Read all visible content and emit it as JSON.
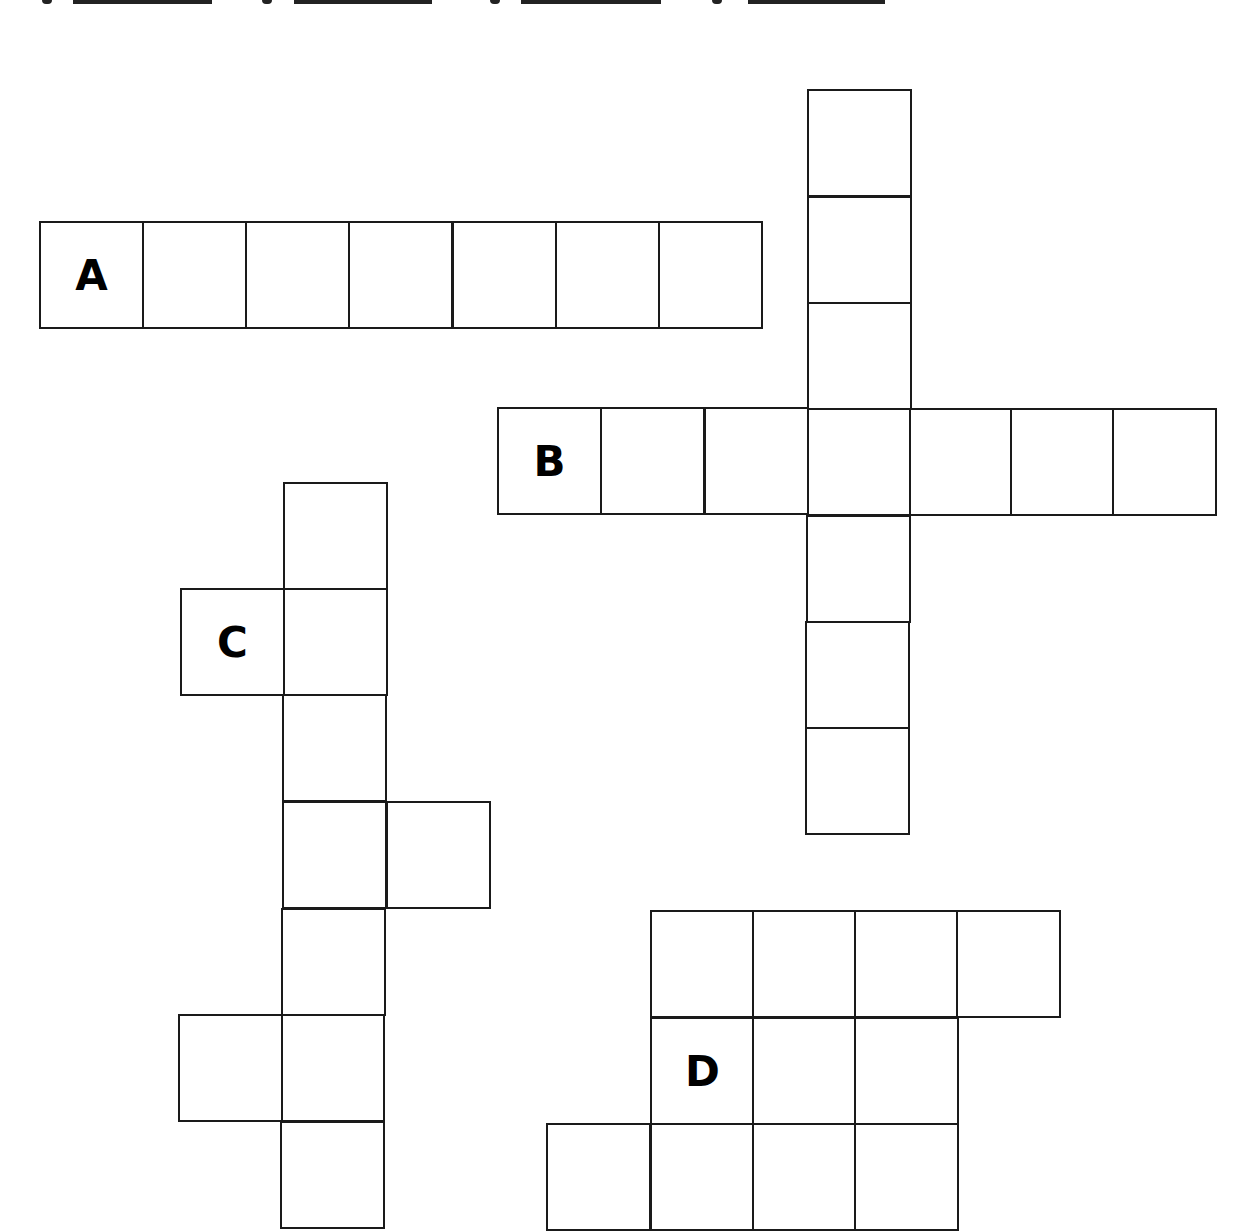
{
  "header": {
    "answer_blanks": [
      {
        "letter": "A",
        "glyph_x": 42,
        "line_x": 73,
        "line_w": 139
      },
      {
        "letter": "B",
        "glyph_x": 262,
        "line_x": 294,
        "line_w": 138
      },
      {
        "letter": "C",
        "glyph_x": 490,
        "line_x": 521,
        "line_w": 140
      },
      {
        "letter": "D",
        "glyph_x": 712,
        "line_x": 748,
        "line_w": 137
      }
    ]
  },
  "puzzle": {
    "type": "crossword-grid",
    "stroke_color": "#1a1a1a",
    "words": [
      {
        "label": "A",
        "direction": "across",
        "length": 7,
        "cells": [
          [
            39,
            221
          ],
          [
            142,
            221
          ],
          [
            245,
            221
          ],
          [
            348,
            221
          ],
          [
            452,
            221
          ],
          [
            555,
            221
          ],
          [
            658,
            221
          ]
        ],
        "label_cell": 0
      },
      {
        "label": "",
        "direction": "down",
        "length": 7,
        "cells": [
          [
            807,
            89
          ],
          [
            807,
            196
          ],
          [
            807,
            302
          ],
          [
            807,
            408
          ],
          [
            806,
            515
          ],
          [
            805,
            621
          ],
          [
            805,
            727
          ]
        ]
      },
      {
        "label": "B",
        "direction": "across",
        "length": 7,
        "cells": [
          [
            497,
            407
          ],
          [
            600,
            407
          ],
          [
            704,
            407
          ],
          [
            807,
            408
          ],
          [
            909,
            408
          ],
          [
            1010,
            408
          ],
          [
            1112,
            408
          ]
        ],
        "label_cell": 0
      },
      {
        "label": "",
        "direction": "down",
        "length": 7,
        "cells": [
          [
            283,
            482
          ],
          [
            283,
            588
          ],
          [
            282,
            694
          ],
          [
            282,
            801
          ],
          [
            281,
            908
          ],
          [
            280,
            1014
          ],
          [
            280,
            1121
          ]
        ]
      },
      {
        "label": "C",
        "direction": "across",
        "length": 2,
        "cells": [
          [
            180,
            588
          ],
          [
            283,
            588
          ]
        ],
        "label_cell": 0
      },
      {
        "label": "",
        "direction": "across",
        "length": 2,
        "cells": [
          [
            282,
            801
          ],
          [
            386,
            801
          ]
        ]
      },
      {
        "label": "",
        "direction": "across",
        "length": 2,
        "cells": [
          [
            178,
            1014
          ],
          [
            280,
            1014
          ]
        ]
      },
      {
        "label": "D",
        "direction": "block",
        "length": 11,
        "cells": [
          [
            650,
            910
          ],
          [
            752,
            910
          ],
          [
            854,
            910
          ],
          [
            956,
            910
          ],
          [
            650,
            1017
          ],
          [
            752,
            1017
          ],
          [
            854,
            1017
          ],
          [
            546,
            1123
          ],
          [
            650,
            1123
          ],
          [
            752,
            1123
          ],
          [
            854,
            1123
          ]
        ],
        "label_cell": 4
      }
    ],
    "labels": [
      {
        "text": "A",
        "x": 39,
        "y": 221
      },
      {
        "text": "B",
        "x": 497,
        "y": 407
      },
      {
        "text": "C",
        "x": 180,
        "y": 588
      },
      {
        "text": "D",
        "x": 650,
        "y": 1017
      }
    ]
  }
}
